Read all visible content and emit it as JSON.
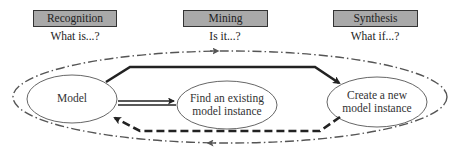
{
  "stages": [
    {
      "title": "Recognition",
      "question": "What is...?"
    },
    {
      "title": "Mining",
      "question": "Is it...?"
    },
    {
      "title": "Synthesis",
      "question": "What if...?"
    }
  ],
  "nodes": {
    "model": "Model",
    "find_line1": "Find an existing",
    "find_line2": "model instance",
    "create_line1": "Create a new",
    "create_line2": "model instance"
  },
  "colors": {
    "header_fill": "#a9a9a9",
    "header_border": "#333333",
    "line": "#222222",
    "loop": "#555555"
  }
}
